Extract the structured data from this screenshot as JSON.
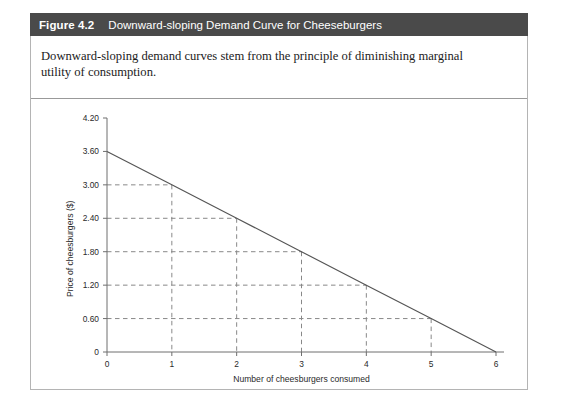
{
  "figure": {
    "number": "Figure 4.2",
    "title": "Downward-sloping Demand Curve for Cheeseburgers",
    "caption": "Downward-sloping demand curves stem from the principle of diminishing marginal utility of consumption.",
    "header_color": "#4a4a4a",
    "border_color": "#b4b4b4"
  },
  "chart_data": {
    "type": "line",
    "title": "",
    "xlabel": "Number of cheesburgers consumed",
    "ylabel": "Price of cheesburgers ($)",
    "x": [
      0,
      1,
      2,
      3,
      4,
      5,
      6
    ],
    "values": [
      3.6,
      3.0,
      2.4,
      1.8,
      1.2,
      0.6,
      0
    ],
    "xlim": [
      0,
      6
    ],
    "ylim": [
      0,
      4.2
    ],
    "xticks": [
      "0",
      "1",
      "2",
      "3",
      "4",
      "5",
      "6"
    ],
    "yticks": [
      "4.20",
      "3.60",
      "3.00",
      "2.40",
      "1.80",
      "1.20",
      "0.60",
      "0"
    ],
    "ytick_values": [
      4.2,
      3.6,
      3.0,
      2.4,
      1.8,
      1.2,
      0.6,
      0
    ],
    "grid": "dashed guide lines from axes to each data point at x = 1,2,3,4,5",
    "guide_points": [
      {
        "x": 1,
        "y": 3.0
      },
      {
        "x": 2,
        "y": 2.4
      },
      {
        "x": 3,
        "y": 1.8
      },
      {
        "x": 4,
        "y": 1.2
      },
      {
        "x": 5,
        "y": 0.6
      }
    ],
    "legend": [],
    "line_color": "#555555",
    "grid_color": "#888888"
  }
}
